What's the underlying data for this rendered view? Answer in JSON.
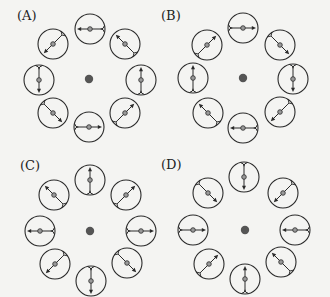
{
  "figure": {
    "background": "#f4f4f2",
    "stroke_color": "#2a2a2a",
    "center_dot_color": "#555555",
    "marker_fill": "#9a9a9a",
    "cell_radius": 15,
    "center_dot_radius": 4.2,
    "position_angles": [
      -90,
      -45,
      0,
      45,
      90,
      135,
      180,
      -135
    ],
    "panels": [
      {
        "id": "A",
        "label": "(A)",
        "label_pos": [
          17,
          9
        ],
        "center": [
          89,
          79
        ],
        "cells": [
          [
            90,
            29
          ],
          [
            125,
            44
          ],
          [
            141,
            80
          ],
          [
            125,
            113
          ],
          [
            89,
            127
          ],
          [
            53,
            113
          ],
          [
            39,
            80
          ],
          [
            53,
            44
          ]
        ],
        "arrow_angles": [
          180,
          -135,
          -90,
          -45,
          0,
          45,
          90,
          135
        ],
        "pattern": "counterclockwise"
      },
      {
        "id": "B",
        "label": "(B)",
        "label_pos": [
          161,
          9
        ],
        "center": [
          243,
          78
        ],
        "cells": [
          [
            243,
            28
          ],
          [
            280,
            45
          ],
          [
            293,
            79
          ],
          [
            280,
            112
          ],
          [
            243,
            128
          ],
          [
            208,
            113
          ],
          [
            193,
            78
          ],
          [
            207,
            45
          ]
        ],
        "arrow_angles": [
          0,
          45,
          90,
          135,
          180,
          -135,
          -90,
          -45
        ],
        "pattern": "clockwise"
      },
      {
        "id": "C",
        "label": "(C)",
        "label_pos": [
          20,
          159
        ],
        "center": [
          90,
          231
        ],
        "cells": [
          [
            90,
            180
          ],
          [
            126,
            195
          ],
          [
            141,
            231
          ],
          [
            127,
            263
          ],
          [
            91,
            281
          ],
          [
            55,
            264
          ],
          [
            40,
            231
          ],
          [
            54,
            195
          ]
        ],
        "arrow_angles": [
          -90,
          -45,
          0,
          45,
          90,
          135,
          180,
          -135
        ],
        "pattern": "outward"
      },
      {
        "id": "D",
        "label": "(D)",
        "label_pos": [
          161,
          158
        ],
        "center": [
          245,
          230
        ],
        "cells": [
          [
            244,
            177
          ],
          [
            283,
            193
          ],
          [
            295,
            230
          ],
          [
            281,
            262
          ],
          [
            245,
            279
          ],
          [
            209,
            264
          ],
          [
            193,
            230
          ],
          [
            208,
            193
          ]
        ],
        "arrow_angles": [
          90,
          135,
          180,
          -135,
          -90,
          -45,
          0,
          45
        ],
        "pattern": "inward"
      }
    ]
  }
}
